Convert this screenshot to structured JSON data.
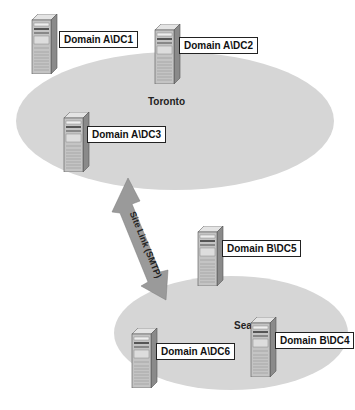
{
  "sites": [
    {
      "name": "Toronto",
      "x": 16,
      "y": 52,
      "w": 318,
      "h": 138,
      "label_x": 148,
      "label_y": 96
    },
    {
      "name": "Seattle",
      "x": 114,
      "y": 276,
      "w": 234,
      "h": 114,
      "label_x": 234,
      "label_y": 320
    }
  ],
  "servers": [
    {
      "id": "dc1",
      "label": "Domain A\\DC1",
      "site": "Toronto",
      "x": 30,
      "y": 14,
      "lx": 59,
      "ly": 31
    },
    {
      "id": "dc2",
      "label": "Domain A\\DC2",
      "site": "Toronto",
      "x": 153,
      "y": 24,
      "lx": 179,
      "ly": 37
    },
    {
      "id": "dc3",
      "label": "Domain A\\DC3",
      "site": "Toronto",
      "x": 62,
      "y": 112,
      "lx": 87,
      "ly": 126
    },
    {
      "id": "dc5",
      "label": "Domain B\\DC5",
      "site": "Seattle",
      "x": 196,
      "y": 226,
      "lx": 222,
      "ly": 240
    },
    {
      "id": "dc6",
      "label": "Domain A\\DC6",
      "site": "Seattle",
      "x": 130,
      "y": 328,
      "lx": 156,
      "ly": 343
    },
    {
      "id": "dc4",
      "label": "Domain B\\DC4",
      "site": "Seattle",
      "x": 249,
      "y": 317,
      "lx": 275,
      "ly": 332
    }
  ],
  "link": {
    "label": "Site Link (SMTP)",
    "color": "#9a9a9a"
  }
}
